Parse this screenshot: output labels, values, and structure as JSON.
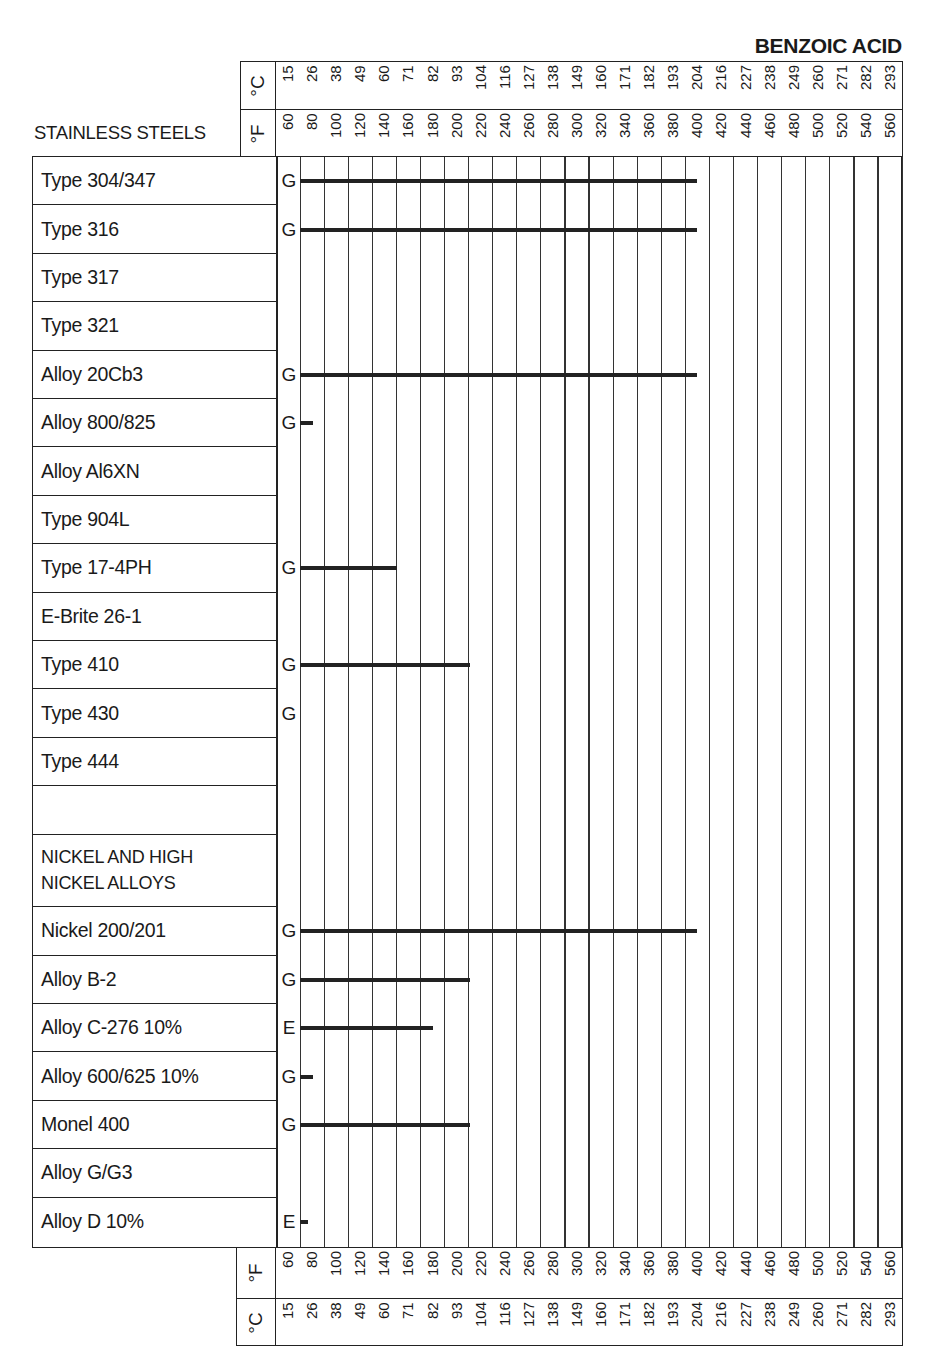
{
  "title": "BENZOIC ACID",
  "section_header": "STAINLESS STEELS",
  "axis": {
    "celsius_unit": "°C",
    "fahrenheit_unit": "°F",
    "celsius": [
      "15",
      "26",
      "38",
      "49",
      "60",
      "71",
      "82",
      "93",
      "104",
      "116",
      "127",
      "138",
      "149",
      "160",
      "171",
      "182",
      "193",
      "204",
      "216",
      "227",
      "238",
      "249",
      "260",
      "271",
      "282",
      "293"
    ],
    "fahrenheit": [
      "60",
      "80",
      "100",
      "120",
      "140",
      "160",
      "180",
      "200",
      "220",
      "240",
      "260",
      "280",
      "300",
      "320",
      "340",
      "360",
      "380",
      "400",
      "420",
      "440",
      "460",
      "480",
      "500",
      "520",
      "540",
      "560"
    ]
  },
  "rows": [
    {
      "label": "Type 304/347",
      "rating": "G",
      "max_f": 400
    },
    {
      "label": "Type 316",
      "rating": "G",
      "max_f": 400
    },
    {
      "label": "Type 317",
      "rating": "",
      "max_f": null
    },
    {
      "label": "Type 321",
      "rating": "",
      "max_f": null
    },
    {
      "label": "Alloy 20Cb3",
      "rating": "G",
      "max_f": 400
    },
    {
      "label": "Alloy 800/825",
      "rating": "G",
      "max_f": 80
    },
    {
      "label": "Alloy Al6XN",
      "rating": "",
      "max_f": null
    },
    {
      "label": "Type 904L",
      "rating": "",
      "max_f": null
    },
    {
      "label": "Type 17-4PH",
      "rating": "G",
      "max_f": 150
    },
    {
      "label": "E-Brite 26-1",
      "rating": "",
      "max_f": null
    },
    {
      "label": "Type 410",
      "rating": "G",
      "max_f": 210
    },
    {
      "label": "Type 430",
      "rating": "G",
      "max_f": null
    },
    {
      "label": "Type 444",
      "rating": "",
      "max_f": null
    },
    {
      "label": "",
      "rating": "",
      "max_f": null,
      "spacer": true
    },
    {
      "label": "NICKEL AND HIGH\nNICKEL ALLOYS",
      "rating": "",
      "max_f": null,
      "group": true
    },
    {
      "label": "Nickel 200/201",
      "rating": "G",
      "max_f": 400
    },
    {
      "label": "Alloy B-2",
      "rating": "G",
      "max_f": 210
    },
    {
      "label": "Alloy C-276 10%",
      "rating": "E",
      "max_f": 180
    },
    {
      "label": "Alloy 600/625 10%",
      "rating": "G",
      "max_f": 80
    },
    {
      "label": "Monel 400",
      "rating": "G",
      "max_f": 210
    },
    {
      "label": "Alloy G/G3",
      "rating": "",
      "max_f": null
    },
    {
      "label": "Alloy D 10%",
      "rating": "E",
      "max_f": 70
    }
  ],
  "chart_data": {
    "type": "bar",
    "orientation": "horizontal",
    "title": "BENZOIC ACID",
    "xlabel": "Temperature (°F / °C)",
    "x_ticks_f": [
      60,
      80,
      100,
      120,
      140,
      160,
      180,
      200,
      220,
      240,
      260,
      280,
      300,
      320,
      340,
      360,
      380,
      400,
      420,
      440,
      460,
      480,
      500,
      520,
      540,
      560
    ],
    "x_ticks_c": [
      15,
      26,
      38,
      49,
      60,
      71,
      82,
      93,
      104,
      116,
      127,
      138,
      149,
      160,
      171,
      182,
      193,
      204,
      216,
      227,
      238,
      249,
      260,
      271,
      282,
      293
    ],
    "xlim_f": [
      60,
      560
    ],
    "legend": {
      "G": "Good",
      "E": "Excellent"
    },
    "groups": [
      {
        "name": "STAINLESS STEELS",
        "series": [
          {
            "name": "Type 304/347",
            "rating": "G",
            "range_f": [
              60,
              400
            ]
          },
          {
            "name": "Type 316",
            "rating": "G",
            "range_f": [
              60,
              400
            ]
          },
          {
            "name": "Type 317",
            "rating": null,
            "range_f": null
          },
          {
            "name": "Type 321",
            "rating": null,
            "range_f": null
          },
          {
            "name": "Alloy 20Cb3",
            "rating": "G",
            "range_f": [
              60,
              400
            ]
          },
          {
            "name": "Alloy 800/825",
            "rating": "G",
            "range_f": [
              60,
              80
            ]
          },
          {
            "name": "Alloy Al6XN",
            "rating": null,
            "range_f": null
          },
          {
            "name": "Type 904L",
            "rating": null,
            "range_f": null
          },
          {
            "name": "Type 17-4PH",
            "rating": "G",
            "range_f": [
              60,
              150
            ]
          },
          {
            "name": "E-Brite 26-1",
            "rating": null,
            "range_f": null
          },
          {
            "name": "Type 410",
            "rating": "G",
            "range_f": [
              60,
              210
            ]
          },
          {
            "name": "Type 430",
            "rating": "G",
            "range_f": [
              60,
              60
            ]
          },
          {
            "name": "Type 444",
            "rating": null,
            "range_f": null
          }
        ]
      },
      {
        "name": "NICKEL AND HIGH NICKEL ALLOYS",
        "series": [
          {
            "name": "Nickel 200/201",
            "rating": "G",
            "range_f": [
              60,
              400
            ]
          },
          {
            "name": "Alloy B-2",
            "rating": "G",
            "range_f": [
              60,
              210
            ]
          },
          {
            "name": "Alloy C-276 10%",
            "rating": "E",
            "range_f": [
              60,
              180
            ]
          },
          {
            "name": "Alloy 600/625 10%",
            "rating": "G",
            "range_f": [
              60,
              80
            ]
          },
          {
            "name": "Monel 400",
            "rating": "G",
            "range_f": [
              60,
              210
            ]
          },
          {
            "name": "Alloy G/G3",
            "rating": null,
            "range_f": null
          },
          {
            "name": "Alloy D 10%",
            "rating": "E",
            "range_f": [
              60,
              70
            ]
          }
        ]
      }
    ]
  }
}
